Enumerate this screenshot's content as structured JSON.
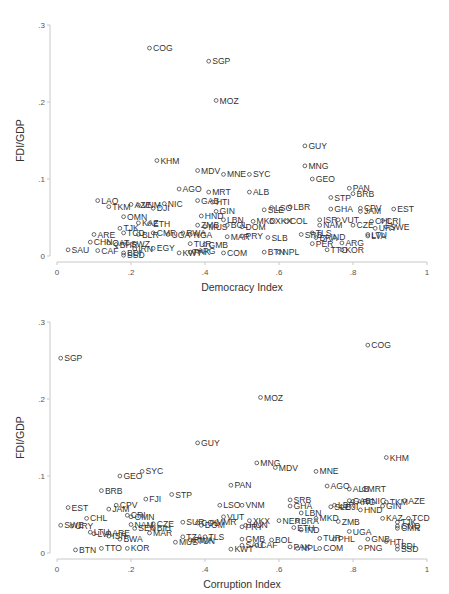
{
  "chart_data": [
    {
      "type": "scatter",
      "title": "",
      "xlabel": "Democracy Index",
      "ylabel": "FDI/GDP",
      "xlim": [
        0,
        1
      ],
      "ylim": [
        0,
        0.3
      ],
      "xticks": [
        "0",
        ".2",
        ".4",
        ".6",
        ".8",
        "1"
      ],
      "yticks": [
        "0",
        ".1",
        ".2",
        ".3"
      ],
      "grid": false,
      "marker": "hollow-circle",
      "points": [
        {
          "label": "COG",
          "x": 0.25,
          "y": 0.27
        },
        {
          "label": "SGP",
          "x": 0.41,
          "y": 0.253
        },
        {
          "label": "MOZ",
          "x": 0.43,
          "y": 0.202
        },
        {
          "label": "GUY",
          "x": 0.67,
          "y": 0.143
        },
        {
          "label": "KHM",
          "x": 0.27,
          "y": 0.124
        },
        {
          "label": "MNG",
          "x": 0.67,
          "y": 0.117
        },
        {
          "label": "MDV",
          "x": 0.38,
          "y": 0.111
        },
        {
          "label": "MNE",
          "x": 0.45,
          "y": 0.106
        },
        {
          "label": "SYC",
          "x": 0.52,
          "y": 0.106
        },
        {
          "label": "GEO",
          "x": 0.69,
          "y": 0.1
        },
        {
          "label": "AGO",
          "x": 0.33,
          "y": 0.087
        },
        {
          "label": "PAN",
          "x": 0.79,
          "y": 0.088
        },
        {
          "label": "MRT",
          "x": 0.41,
          "y": 0.083
        },
        {
          "label": "ALB",
          "x": 0.52,
          "y": 0.083
        },
        {
          "label": "BRB",
          "x": 0.8,
          "y": 0.081
        },
        {
          "label": "STP",
          "x": 0.74,
          "y": 0.076
        },
        {
          "label": "LAO",
          "x": 0.11,
          "y": 0.072
        },
        {
          "label": "NIC",
          "x": 0.29,
          "y": 0.068
        },
        {
          "label": "AZE",
          "x": 0.2,
          "y": 0.067
        },
        {
          "label": "TKM",
          "x": 0.14,
          "y": 0.064
        },
        {
          "label": "VNM",
          "x": 0.22,
          "y": 0.066
        },
        {
          "label": "DJI",
          "x": 0.26,
          "y": 0.062
        },
        {
          "label": "GAB",
          "x": 0.38,
          "y": 0.072
        },
        {
          "label": "HTI",
          "x": 0.42,
          "y": 0.07
        },
        {
          "label": "GHA",
          "x": 0.74,
          "y": 0.061
        },
        {
          "label": "CPV",
          "x": 0.82,
          "y": 0.062
        },
        {
          "label": "JAM",
          "x": 0.82,
          "y": 0.058
        },
        {
          "label": "EST",
          "x": 0.91,
          "y": 0.061
        },
        {
          "label": "LSO",
          "x": 0.58,
          "y": 0.063
        },
        {
          "label": "LBR",
          "x": 0.63,
          "y": 0.064
        },
        {
          "label": "SLE",
          "x": 0.56,
          "y": 0.06
        },
        {
          "label": "GIN",
          "x": 0.43,
          "y": 0.058
        },
        {
          "label": "OMN",
          "x": 0.18,
          "y": 0.051
        },
        {
          "label": "KAZ",
          "x": 0.22,
          "y": 0.043
        },
        {
          "label": "ETH",
          "x": 0.25,
          "y": 0.042
        },
        {
          "label": "HND",
          "x": 0.39,
          "y": 0.052
        },
        {
          "label": "LBN",
          "x": 0.45,
          "y": 0.047
        },
        {
          "label": "MKD",
          "x": 0.53,
          "y": 0.045
        },
        {
          "label": "XKX",
          "x": 0.58,
          "y": 0.045
        },
        {
          "label": "COL",
          "x": 0.62,
          "y": 0.045
        },
        {
          "label": "ISR",
          "x": 0.71,
          "y": 0.047
        },
        {
          "label": "VUT",
          "x": 0.76,
          "y": 0.047
        },
        {
          "label": "CRI",
          "x": 0.88,
          "y": 0.046
        },
        {
          "label": "CHL",
          "x": 0.85,
          "y": 0.045
        },
        {
          "label": "NAM",
          "x": 0.71,
          "y": 0.04
        },
        {
          "label": "CZE",
          "x": 0.8,
          "y": 0.04
        },
        {
          "label": "SWE",
          "x": 0.89,
          "y": 0.038
        },
        {
          "label": "URY",
          "x": 0.86,
          "y": 0.036
        },
        {
          "label": "TJK",
          "x": 0.17,
          "y": 0.036
        },
        {
          "label": "ZMB",
          "x": 0.38,
          "y": 0.04
        },
        {
          "label": "MUS",
          "x": 0.4,
          "y": 0.038
        },
        {
          "label": "BOL",
          "x": 0.46,
          "y": 0.04
        },
        {
          "label": "DOM",
          "x": 0.5,
          "y": 0.038
        },
        {
          "label": "ARE",
          "x": 0.1,
          "y": 0.028
        },
        {
          "label": "TCD",
          "x": 0.18,
          "y": 0.03
        },
        {
          "label": "BLR",
          "x": 0.22,
          "y": 0.028
        },
        {
          "label": "CMR",
          "x": 0.26,
          "y": 0.03
        },
        {
          "label": "UGA",
          "x": 0.3,
          "y": 0.028
        },
        {
          "label": "RWA",
          "x": 0.34,
          "y": 0.03
        },
        {
          "label": "NGA",
          "x": 0.36,
          "y": 0.028
        },
        {
          "label": "MAR",
          "x": 0.46,
          "y": 0.025
        },
        {
          "label": "PRY",
          "x": 0.5,
          "y": 0.026
        },
        {
          "label": "SLB",
          "x": 0.57,
          "y": 0.024
        },
        {
          "label": "SRB",
          "x": 0.66,
          "y": 0.028
        },
        {
          "label": "TLS",
          "x": 0.69,
          "y": 0.03
        },
        {
          "label": "BRA",
          "x": 0.7,
          "y": 0.024
        },
        {
          "label": "IND",
          "x": 0.73,
          "y": 0.025
        },
        {
          "label": "LTU",
          "x": 0.84,
          "y": 0.028
        },
        {
          "label": "LVA",
          "x": 0.84,
          "y": 0.026
        },
        {
          "label": "CHN",
          "x": 0.09,
          "y": 0.018
        },
        {
          "label": "QAT",
          "x": 0.14,
          "y": 0.017
        },
        {
          "label": "BHR",
          "x": 0.16,
          "y": 0.015
        },
        {
          "label": "SWZ",
          "x": 0.19,
          "y": 0.016
        },
        {
          "label": "TUR",
          "x": 0.36,
          "y": 0.016
        },
        {
          "label": "GMB",
          "x": 0.4,
          "y": 0.015
        },
        {
          "label": "PER",
          "x": 0.69,
          "y": 0.016
        },
        {
          "label": "ARG",
          "x": 0.77,
          "y": 0.017
        },
        {
          "label": "SAU",
          "x": 0.03,
          "y": 0.008
        },
        {
          "label": "CAF",
          "x": 0.11,
          "y": 0.007
        },
        {
          "label": "IRN",
          "x": 0.21,
          "y": 0.009
        },
        {
          "label": "EGY",
          "x": 0.26,
          "y": 0.01
        },
        {
          "label": "PAK",
          "x": 0.36,
          "y": 0.005
        },
        {
          "label": "KWT",
          "x": 0.33,
          "y": 0.004
        },
        {
          "label": "APG",
          "x": 0.37,
          "y": 0.006
        },
        {
          "label": "COM",
          "x": 0.45,
          "y": 0.004
        },
        {
          "label": "BTN",
          "x": 0.56,
          "y": 0.005
        },
        {
          "label": "NPL",
          "x": 0.6,
          "y": 0.005
        },
        {
          "label": "TTO",
          "x": 0.73,
          "y": 0.008
        },
        {
          "label": "KOR",
          "x": 0.77,
          "y": 0.008
        },
        {
          "label": "BDI",
          "x": 0.18,
          "y": 0.004
        },
        {
          "label": "SSD",
          "x": 0.18,
          "y": 0.001
        }
      ]
    },
    {
      "type": "scatter",
      "title": "",
      "xlabel": "Corruption Index",
      "ylabel": "FDI/GDP",
      "xlim": [
        0,
        1
      ],
      "ylim": [
        0,
        0.3
      ],
      "xticks": [
        "0",
        ".2",
        ".4",
        ".6",
        ".8",
        "1"
      ],
      "yticks": [
        "0",
        ".1",
        ".2",
        ".3"
      ],
      "grid": false,
      "marker": "hollow-circle",
      "points": [
        {
          "label": "COG",
          "x": 0.84,
          "y": 0.27
        },
        {
          "label": "SGP",
          "x": 0.01,
          "y": 0.253
        },
        {
          "label": "MOZ",
          "x": 0.55,
          "y": 0.202
        },
        {
          "label": "GUY",
          "x": 0.38,
          "y": 0.143
        },
        {
          "label": "KHM",
          "x": 0.89,
          "y": 0.124
        },
        {
          "label": "MNG",
          "x": 0.54,
          "y": 0.117
        },
        {
          "label": "MDV",
          "x": 0.59,
          "y": 0.111
        },
        {
          "label": "MNE",
          "x": 0.7,
          "y": 0.106
        },
        {
          "label": "SYC",
          "x": 0.23,
          "y": 0.106
        },
        {
          "label": "GEO",
          "x": 0.17,
          "y": 0.1
        },
        {
          "label": "PAN",
          "x": 0.47,
          "y": 0.088
        },
        {
          "label": "AGO",
          "x": 0.73,
          "y": 0.087
        },
        {
          "label": "ALB",
          "x": 0.79,
          "y": 0.083
        },
        {
          "label": "MRT",
          "x": 0.83,
          "y": 0.083
        },
        {
          "label": "BRB",
          "x": 0.12,
          "y": 0.081
        },
        {
          "label": "STP",
          "x": 0.31,
          "y": 0.076
        },
        {
          "label": "FJI",
          "x": 0.24,
          "y": 0.07
        },
        {
          "label": "SRB",
          "x": 0.63,
          "y": 0.069
        },
        {
          "label": "GAB",
          "x": 0.79,
          "y": 0.068
        },
        {
          "label": "ARG",
          "x": 0.8,
          "y": 0.067
        },
        {
          "label": "NIC",
          "x": 0.84,
          "y": 0.068
        },
        {
          "label": "TKM",
          "x": 0.89,
          "y": 0.066
        },
        {
          "label": "AZE",
          "x": 0.94,
          "y": 0.068
        },
        {
          "label": "CPV",
          "x": 0.16,
          "y": 0.062
        },
        {
          "label": "LSO",
          "x": 0.44,
          "y": 0.062
        },
        {
          "label": "VNM",
          "x": 0.5,
          "y": 0.062
        },
        {
          "label": "GHA",
          "x": 0.63,
          "y": 0.061
        },
        {
          "label": "LBR",
          "x": 0.75,
          "y": 0.062
        },
        {
          "label": "SLE",
          "x": 0.74,
          "y": 0.06
        },
        {
          "label": "DJI",
          "x": 0.77,
          "y": 0.06
        },
        {
          "label": "GIN",
          "x": 0.88,
          "y": 0.061
        },
        {
          "label": "EST",
          "x": 0.03,
          "y": 0.059
        },
        {
          "label": "JAM",
          "x": 0.14,
          "y": 0.057
        },
        {
          "label": "HND",
          "x": 0.82,
          "y": 0.056
        },
        {
          "label": "LBN",
          "x": 0.66,
          "y": 0.052
        },
        {
          "label": "CRI",
          "x": 0.19,
          "y": 0.049
        },
        {
          "label": "CHL",
          "x": 0.08,
          "y": 0.045
        },
        {
          "label": "OMN",
          "x": 0.2,
          "y": 0.047
        },
        {
          "label": "VUT",
          "x": 0.45,
          "y": 0.047
        },
        {
          "label": "MKD",
          "x": 0.7,
          "y": 0.045
        },
        {
          "label": "KAZ",
          "x": 0.88,
          "y": 0.045
        },
        {
          "label": "TCD",
          "x": 0.95,
          "y": 0.045
        },
        {
          "label": "XKX",
          "x": 0.52,
          "y": 0.042
        },
        {
          "label": "NER",
          "x": 0.6,
          "y": 0.042
        },
        {
          "label": "BRA",
          "x": 0.65,
          "y": 0.042
        },
        {
          "label": "SUR",
          "x": 0.34,
          "y": 0.04
        },
        {
          "label": "COL",
          "x": 0.38,
          "y": 0.039
        },
        {
          "label": "MMR",
          "x": 0.42,
          "y": 0.04
        },
        {
          "label": "DOM",
          "x": 0.39,
          "y": 0.036
        },
        {
          "label": "ZMB",
          "x": 0.76,
          "y": 0.041
        },
        {
          "label": "SWE",
          "x": 0.01,
          "y": 0.036
        },
        {
          "label": "URY",
          "x": 0.04,
          "y": 0.035
        },
        {
          "label": "NAM",
          "x": 0.2,
          "y": 0.037
        },
        {
          "label": "CZE",
          "x": 0.26,
          "y": 0.038
        },
        {
          "label": "TJK",
          "x": 0.92,
          "y": 0.04
        },
        {
          "label": "GNQ",
          "x": 0.92,
          "y": 0.035
        },
        {
          "label": "CMR",
          "x": 0.92,
          "y": 0.032
        },
        {
          "label": "SEN",
          "x": 0.21,
          "y": 0.032
        },
        {
          "label": "BIH",
          "x": 0.26,
          "y": 0.032
        },
        {
          "label": "MAR",
          "x": 0.25,
          "y": 0.026
        },
        {
          "label": "PRY",
          "x": 0.5,
          "y": 0.034
        },
        {
          "label": "HUN",
          "x": 0.51,
          "y": 0.036
        },
        {
          "label": "ETH",
          "x": 0.64,
          "y": 0.033
        },
        {
          "label": "IND",
          "x": 0.66,
          "y": 0.03
        },
        {
          "label": "UGA",
          "x": 0.79,
          "y": 0.028
        },
        {
          "label": "LTU",
          "x": 0.09,
          "y": 0.027
        },
        {
          "label": "LVA",
          "x": 0.1,
          "y": 0.025
        },
        {
          "label": "ARE",
          "x": 0.14,
          "y": 0.026
        },
        {
          "label": "ISR",
          "x": 0.14,
          "y": 0.022
        },
        {
          "label": "BWA",
          "x": 0.17,
          "y": 0.018
        },
        {
          "label": "TZA",
          "x": 0.34,
          "y": 0.021
        },
        {
          "label": "TLS",
          "x": 0.4,
          "y": 0.021
        },
        {
          "label": "RWA",
          "x": 0.36,
          "y": 0.017
        },
        {
          "label": "TUN",
          "x": 0.37,
          "y": 0.016
        },
        {
          "label": "MUS",
          "x": 0.32,
          "y": 0.014
        },
        {
          "label": "BOL",
          "x": 0.58,
          "y": 0.017
        },
        {
          "label": "GMB",
          "x": 0.5,
          "y": 0.018
        },
        {
          "label": "TUR",
          "x": 0.71,
          "y": 0.019
        },
        {
          "label": "PHL",
          "x": 0.75,
          "y": 0.018
        },
        {
          "label": "GNB",
          "x": 0.84,
          "y": 0.018
        },
        {
          "label": "HTI",
          "x": 0.89,
          "y": 0.015
        },
        {
          "label": "SAU",
          "x": 0.5,
          "y": 0.01
        },
        {
          "label": "CAF",
          "x": 0.54,
          "y": 0.01
        },
        {
          "label": "PAK",
          "x": 0.63,
          "y": 0.008
        },
        {
          "label": "NPL",
          "x": 0.65,
          "y": 0.006
        },
        {
          "label": "COM",
          "x": 0.71,
          "y": 0.006
        },
        {
          "label": "PNG",
          "x": 0.82,
          "y": 0.007
        },
        {
          "label": "KWT",
          "x": 0.47,
          "y": 0.005
        },
        {
          "label": "BDI",
          "x": 0.92,
          "y": 0.009
        },
        {
          "label": "SSD",
          "x": 0.92,
          "y": 0.005
        },
        {
          "label": "BTN",
          "x": 0.05,
          "y": 0.004
        },
        {
          "label": "TTO",
          "x": 0.12,
          "y": 0.006
        },
        {
          "label": "KOR",
          "x": 0.19,
          "y": 0.006
        }
      ]
    }
  ]
}
